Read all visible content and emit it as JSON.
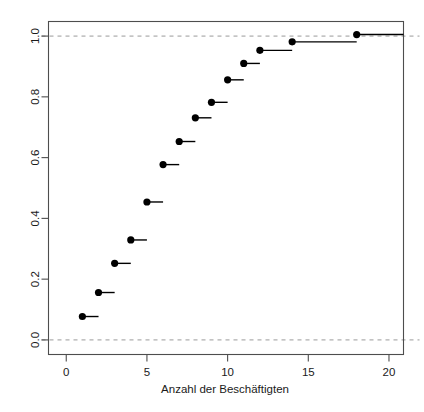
{
  "chart_data": {
    "type": "line",
    "subtype": "ecdf-step",
    "title": "",
    "xlabel": "Anzahl der Beschäftigten",
    "ylabel": "",
    "xlim": [
      -1.1,
      20.9
    ],
    "ylim": [
      -0.048,
      1.048
    ],
    "xticks": [
      0,
      5,
      10,
      15,
      20
    ],
    "xtick_labels": [
      "0",
      "5",
      "10",
      "15",
      "20"
    ],
    "yticks": [
      0.0,
      0.2,
      0.4,
      0.6,
      0.8,
      1.0
    ],
    "ytick_labels": [
      "0.0",
      "0.2",
      "0.4",
      "0.6",
      "0.8",
      "1.0"
    ],
    "grid": false,
    "legend": null,
    "reference_lines": [
      {
        "name": "lower-bound",
        "orientation": "horizontal",
        "y": 0.0,
        "style": "dashed",
        "color": "#9a9a9a"
      },
      {
        "name": "upper-bound",
        "orientation": "horizontal",
        "y": 1.0,
        "style": "dashed",
        "color": "#9a9a9a"
      }
    ],
    "point_color": "#000000",
    "line_color": "#000000",
    "x": [
      1,
      2,
      3,
      4,
      5,
      6,
      7,
      8,
      9,
      10,
      11,
      12,
      14,
      18
    ],
    "y": [
      0.077,
      0.156,
      0.252,
      0.329,
      0.454,
      0.577,
      0.653,
      0.731,
      0.782,
      0.856,
      0.91,
      0.953,
      0.981,
      1.005
    ],
    "step_end_x": [
      2.0,
      3.0,
      4.0,
      5.0,
      6.0,
      7.0,
      8.0,
      9.0,
      10.0,
      11.0,
      12.0,
      14.0,
      18.0,
      20.9
    ],
    "points": [
      {
        "x": 1,
        "y": 0.077
      },
      {
        "x": 2,
        "y": 0.156
      },
      {
        "x": 3,
        "y": 0.252
      },
      {
        "x": 4,
        "y": 0.329
      },
      {
        "x": 5,
        "y": 0.454
      },
      {
        "x": 6,
        "y": 0.577
      },
      {
        "x": 7,
        "y": 0.653
      },
      {
        "x": 8,
        "y": 0.731
      },
      {
        "x": 9,
        "y": 0.782
      },
      {
        "x": 10,
        "y": 0.856
      },
      {
        "x": 11,
        "y": 0.91
      },
      {
        "x": 12,
        "y": 0.953
      },
      {
        "x": 14,
        "y": 0.981
      },
      {
        "x": 18,
        "y": 1.005
      }
    ]
  },
  "axis": {
    "x_title": "Anzahl der Beschäftigten"
  }
}
